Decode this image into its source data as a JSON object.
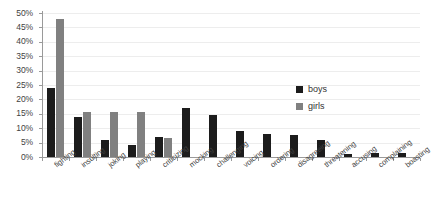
{
  "chart_data": {
    "type": "bar",
    "title": "",
    "subtitle": "",
    "xlabel": "",
    "ylabel": "",
    "ylim": [
      0,
      50
    ],
    "ytick_values": [
      0,
      5,
      10,
      15,
      20,
      25,
      30,
      35,
      40,
      45,
      50
    ],
    "ytick_labels": [
      "0%",
      "5%",
      "10%",
      "15%",
      "20%",
      "25%",
      "30%",
      "35%",
      "40%",
      "45%",
      "50%"
    ],
    "grid": true,
    "legend_position": "inside-right",
    "categories": [
      "fighting",
      "insulting",
      "joking",
      "playing",
      "criticizing",
      "mocking",
      "challenging",
      "voicing",
      "ordering",
      "disagreeing",
      "threatening",
      "accusing",
      "complaining",
      "boasting"
    ],
    "series": [
      {
        "name": "boys",
        "color": "#1c1c1c",
        "values": [
          24,
          14,
          6,
          4,
          7,
          17,
          14.5,
          9,
          8,
          7.5,
          6,
          1.2,
          1.4,
          1.5
        ]
      },
      {
        "name": "girls",
        "color": "#808080",
        "values": [
          48,
          15.5,
          15.5,
          15.5,
          6.5,
          0,
          0,
          0,
          0,
          0,
          0,
          0,
          0,
          0
        ]
      }
    ]
  },
  "legend": {
    "entries": [
      {
        "label": "boys"
      },
      {
        "label": "girls"
      }
    ]
  },
  "colors": {
    "boys": "#1c1c1c",
    "girls": "#808080",
    "axis": "#9a9a9a",
    "grid": "#ededed",
    "text": "#3f3f3f",
    "background": "#ffffff"
  }
}
